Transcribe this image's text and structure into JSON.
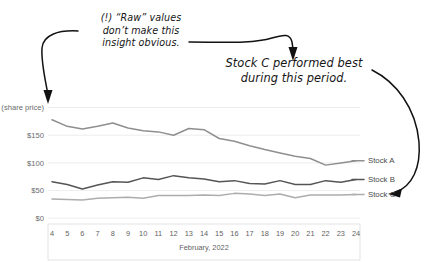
{
  "annotations": {
    "raw_note": "(!) “Raw” values\ndon’t make this\ninsight obvious.",
    "insight_note": "Stock C performed best\nduring this period."
  },
  "colors": {
    "stock_a": "#8f8f8f",
    "stock_b": "#555555",
    "stock_c": "#adadad",
    "gridline": "#e9e9e9",
    "annotation_ink": "#121212",
    "axis_text": "#5f5f5f"
  },
  "chart_data": {
    "type": "line",
    "title": "",
    "xlabel": "February, 2022",
    "ylabel": "$200 (share price)",
    "grid": true,
    "legend_position": "right-inline",
    "x": [
      4,
      5,
      6,
      7,
      8,
      9,
      10,
      11,
      12,
      13,
      14,
      15,
      16,
      17,
      18,
      19,
      20,
      21,
      22,
      23,
      24
    ],
    "xtick_labels": [
      "4",
      "5",
      "6",
      "7",
      "8",
      "9",
      "10",
      "11",
      "12",
      "13",
      "14",
      "15",
      "16",
      "17",
      "18",
      "19",
      "20",
      "21",
      "22",
      "23",
      "24"
    ],
    "ytick_labels": [
      "$0",
      "$50",
      "$100",
      "$150",
      "$200 (share price)"
    ],
    "yticks": [
      0,
      50,
      100,
      150,
      200
    ],
    "ylim": [
      0,
      210
    ],
    "series": [
      {
        "name": "Stock A",
        "color": "#8f8f8f",
        "values": [
          178,
          166,
          161,
          166,
          172,
          163,
          158,
          156,
          150,
          162,
          160,
          144,
          139,
          131,
          124,
          118,
          112,
          108,
          96,
          100,
          104
        ]
      },
      {
        "name": "Stock B",
        "color": "#555555",
        "values": [
          66,
          61,
          53,
          60,
          66,
          65,
          73,
          70,
          77,
          73,
          71,
          66,
          68,
          63,
          62,
          68,
          61,
          61,
          68,
          65,
          70
        ]
      },
      {
        "name": "Stock C",
        "color": "#adadad",
        "values": [
          35,
          34,
          33,
          36,
          37,
          38,
          36,
          41,
          41,
          41,
          42,
          41,
          45,
          44,
          41,
          44,
          37,
          42,
          42,
          42,
          43
        ]
      }
    ]
  }
}
